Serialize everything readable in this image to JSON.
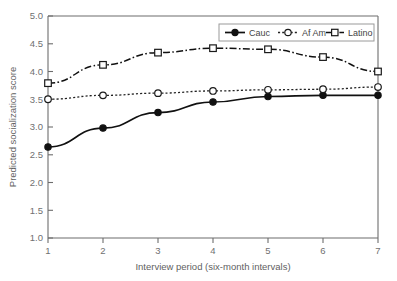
{
  "chart_data": {
    "type": "line",
    "title": "",
    "xlabel": "Interview period (six-month intervals)",
    "ylabel": "Predicted socialization score",
    "x": [
      1,
      2,
      3,
      4,
      5,
      6,
      7
    ],
    "xtick_labels": [
      "1",
      "2",
      "3",
      "4",
      "5",
      "6",
      "7"
    ],
    "ytick_labels": [
      "1.0",
      "1.5",
      "2.0",
      "2.5",
      "3.0",
      "3.5",
      "4.0",
      "4.5",
      "5.0"
    ],
    "yticks": [
      1.0,
      1.5,
      2.0,
      2.5,
      3.0,
      3.5,
      4.0,
      4.5,
      5.0
    ],
    "xlim": [
      1,
      7
    ],
    "ylim": [
      1.0,
      5.0
    ],
    "grid": false,
    "legend_position": "top-right",
    "series": [
      {
        "name": "Cauc",
        "values": [
          2.64,
          2.98,
          3.26,
          3.45,
          3.55,
          3.57,
          3.57
        ],
        "line_style": "solid",
        "marker": "filled-circle",
        "color": "#111111"
      },
      {
        "name": "Af Am",
        "values": [
          3.5,
          3.57,
          3.61,
          3.65,
          3.67,
          3.68,
          3.72
        ],
        "line_style": "dotted",
        "marker": "open-circle",
        "color": "#222222"
      },
      {
        "name": "Latino",
        "values": [
          3.79,
          4.12,
          4.34,
          4.42,
          4.4,
          4.26,
          4.0
        ],
        "line_style": "dash-dot",
        "marker": "open-square",
        "color": "#111111"
      }
    ]
  },
  "legend": {
    "items": [
      {
        "label": "Cauc"
      },
      {
        "label": "Af Am"
      },
      {
        "label": "Latino"
      }
    ]
  }
}
